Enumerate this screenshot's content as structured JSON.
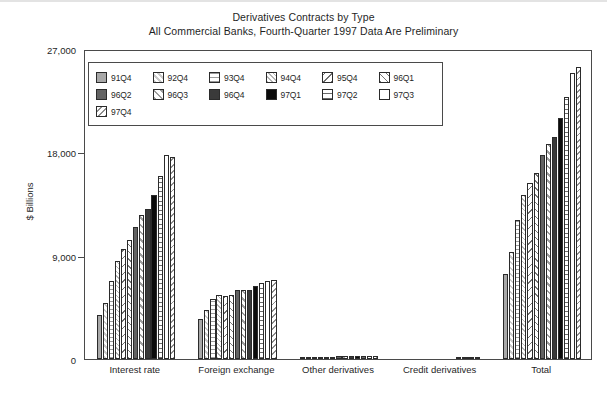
{
  "chart_data": {
    "type": "bar",
    "title": "Derivatives Contracts by Type",
    "subtitle": "All Commercial Banks, Fourth-Quarter 1997 Data Are Preliminary",
    "xlabel": "",
    "ylabel": "$ Billions",
    "ylim": [
      0,
      27000
    ],
    "yticks": [
      0,
      9000,
      18000,
      27000
    ],
    "ytick_labels": [
      "0",
      "9,000",
      "18,000",
      "27,000"
    ],
    "grid": false,
    "legend_position": "inside-top-left",
    "categories": [
      "Interest rate",
      "Foreign exchange",
      "Other derivatives",
      "Credit derivatives",
      "Total"
    ],
    "series": [
      {
        "name": "91Q4",
        "pattern": "solid-gray",
        "values": [
          3800,
          3500,
          110,
          0,
          7400
        ]
      },
      {
        "name": "92Q4",
        "pattern": "diag-hatch-light",
        "values": [
          4900,
          4300,
          130,
          0,
          9300
        ]
      },
      {
        "name": "93Q4",
        "pattern": "horiz-dots",
        "values": [
          6800,
          5200,
          150,
          0,
          12150
        ]
      },
      {
        "name": "94Q4",
        "pattern": "cross-hatch-light",
        "values": [
          8500,
          5600,
          170,
          0,
          14270
        ]
      },
      {
        "name": "95Q4",
        "pattern": "diag-line-sparse",
        "values": [
          9600,
          5500,
          190,
          0,
          15290
        ]
      },
      {
        "name": "96Q1",
        "pattern": "cross-hatch",
        "values": [
          10400,
          5600,
          210,
          0,
          16210
        ]
      },
      {
        "name": "96Q2",
        "pattern": "solid-darkgray",
        "values": [
          11500,
          6000,
          230,
          0,
          17730
        ]
      },
      {
        "name": "96Q3",
        "pattern": "diag-hatch-wide",
        "values": [
          12500,
          6000,
          250,
          0,
          18750
        ]
      },
      {
        "name": "96Q4",
        "pattern": "solid-charcoal",
        "values": [
          13100,
          6000,
          250,
          0,
          19350
        ]
      },
      {
        "name": "97Q1",
        "pattern": "solid-black",
        "values": [
          14300,
          6400,
          250,
          20,
          20970
        ]
      },
      {
        "name": "97Q2",
        "pattern": "horiz-lines",
        "values": [
          15900,
          6600,
          260,
          40,
          22800
        ]
      },
      {
        "name": "97Q3",
        "pattern": "white",
        "values": [
          17800,
          6800,
          260,
          50,
          24910
        ]
      },
      {
        "name": "97Q4",
        "pattern": "diag-hatch-gray",
        "values": [
          17600,
          6900,
          270,
          60,
          25430
        ]
      }
    ]
  }
}
